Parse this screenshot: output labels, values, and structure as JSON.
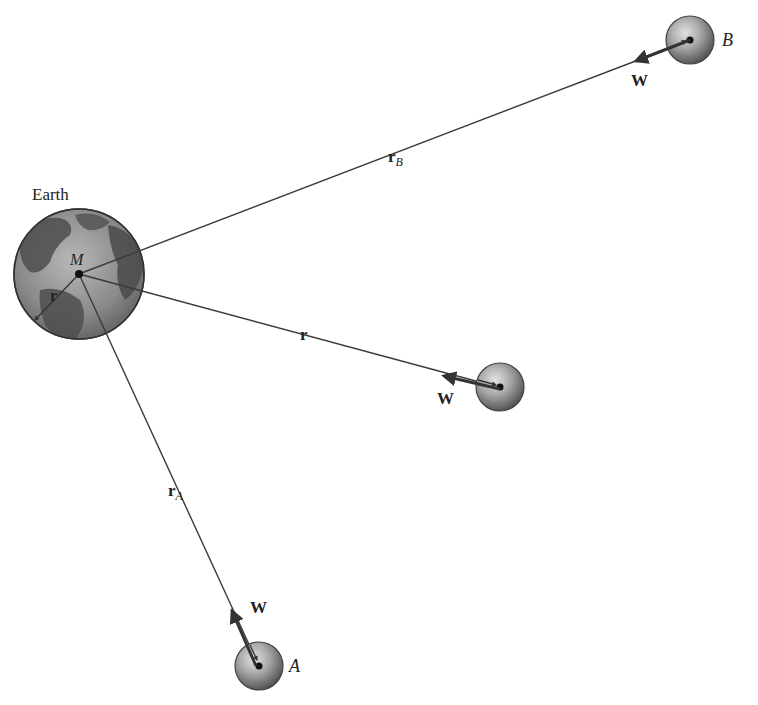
{
  "figure": {
    "type": "physics-diagram"
  },
  "labels": {
    "earth": "Earth",
    "earth_mass": "M",
    "earth_radius": "r",
    "r_B_main": "r",
    "r_B_sub": "B",
    "r_main": "r",
    "r_A_main": "r",
    "r_A_sub": "A",
    "weight_B": "W",
    "weight_mid": "W",
    "weight_A": "W",
    "body_B": "B",
    "body_A": "A"
  },
  "colors": {
    "line": "#3a3a3a",
    "arrow": "#333333",
    "earth_ocean": "#8a8a8a",
    "earth_land": "#4e4e4e",
    "sphere_dark": "#5a5a5a",
    "sphere_light": "#d8d8d8"
  },
  "geometry": {
    "earth": {
      "cx": 79,
      "cy": 274,
      "r": 65
    },
    "body_B": {
      "cx": 690,
      "cy": 40,
      "r": 24
    },
    "body_mid": {
      "cx": 500,
      "cy": 387,
      "r": 24
    },
    "body_A": {
      "cx": 259,
      "cy": 666,
      "r": 24
    }
  }
}
